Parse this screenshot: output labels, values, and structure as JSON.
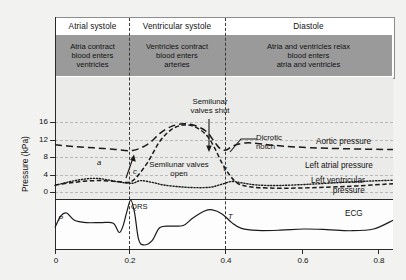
{
  "header": {
    "phases": [
      {
        "name": "Atrial systole",
        "desc": [
          "Atria contract",
          "blood enters",
          "ventricles"
        ]
      },
      {
        "name": "Ventricular systole",
        "desc": [
          "Ventricles contract",
          "blood enters",
          "arteries"
        ]
      },
      {
        "name": "Diastole",
        "desc": [
          "Atria and ventricles relax",
          "blood enters",
          "atria and ventricles"
        ]
      }
    ]
  },
  "annotations": {
    "semilunar_shut": [
      "Semilunar",
      "valves shut"
    ],
    "dicrotic_notch": [
      "Dicrotic",
      "notch"
    ],
    "semilunar_open": [
      "Semilunar valves",
      "open"
    ],
    "wave_a": "a",
    "wave_c": "c",
    "wave_v": "v",
    "ecg_p": "P",
    "ecg_qrs": "QRS",
    "ecg_t": "T"
  },
  "curve_labels": {
    "aortic": "Aortic pressure",
    "atrial": "Left atrial pressure",
    "ventricular": [
      "Left ventricular",
      "pressure"
    ],
    "ecg": "ECG"
  },
  "chart_data": {
    "type": "line",
    "title": "",
    "xlabel": "",
    "ylabel": "Pressure (kPa)",
    "xlim": [
      0,
      0.87
    ],
    "ylim": [
      0,
      18
    ],
    "xticks": [
      "0",
      "0.2",
      "0.4",
      "0.6",
      "0.8"
    ],
    "xtick_values": [
      0,
      0.2,
      0.4,
      0.6,
      0.8
    ],
    "yticks": [
      "0",
      "4",
      "8",
      "12",
      "16"
    ],
    "ytick_values": [
      0,
      4,
      8,
      12,
      16
    ],
    "grid": true,
    "legend": "right-inline",
    "phase_boundaries": [
      0.2,
      0.4
    ],
    "series": [
      {
        "name": "Aortic pressure",
        "style": "long-dash",
        "points": [
          [
            0.0,
            10.8
          ],
          [
            0.05,
            10.4
          ],
          [
            0.1,
            10.1
          ],
          [
            0.15,
            9.8
          ],
          [
            0.2,
            9.5
          ],
          [
            0.24,
            11.0
          ],
          [
            0.27,
            13.4
          ],
          [
            0.3,
            15.0
          ],
          [
            0.33,
            15.6
          ],
          [
            0.36,
            15.2
          ],
          [
            0.39,
            13.8
          ],
          [
            0.41,
            11.5
          ],
          [
            0.425,
            9.9
          ],
          [
            0.44,
            9.6
          ],
          [
            0.46,
            10.6
          ],
          [
            0.49,
            11.2
          ],
          [
            0.52,
            11.1
          ],
          [
            0.56,
            10.7
          ],
          [
            0.62,
            10.3
          ],
          [
            0.7,
            10.0
          ],
          [
            0.8,
            9.8
          ],
          [
            0.87,
            9.7
          ]
        ]
      },
      {
        "name": "Left ventricular pressure",
        "style": "dash",
        "points": [
          [
            0.0,
            1.6
          ],
          [
            0.04,
            2.1
          ],
          [
            0.08,
            2.5
          ],
          [
            0.12,
            2.6
          ],
          [
            0.16,
            2.4
          ],
          [
            0.19,
            2.2
          ],
          [
            0.21,
            3.4
          ],
          [
            0.24,
            7.0
          ],
          [
            0.27,
            11.6
          ],
          [
            0.3,
            14.3
          ],
          [
            0.33,
            15.3
          ],
          [
            0.36,
            14.9
          ],
          [
            0.39,
            13.0
          ],
          [
            0.41,
            10.2
          ],
          [
            0.43,
            6.6
          ],
          [
            0.45,
            3.8
          ],
          [
            0.47,
            2.0
          ],
          [
            0.5,
            1.2
          ],
          [
            0.55,
            0.9
          ],
          [
            0.62,
            0.9
          ],
          [
            0.7,
            1.1
          ],
          [
            0.78,
            1.4
          ],
          [
            0.87,
            1.9
          ]
        ]
      },
      {
        "name": "Left atrial pressure",
        "style": "dot",
        "points": [
          [
            0.0,
            1.5
          ],
          [
            0.04,
            2.4
          ],
          [
            0.08,
            3.0
          ],
          [
            0.11,
            3.1
          ],
          [
            0.14,
            2.7
          ],
          [
            0.17,
            2.2
          ],
          [
            0.2,
            2.0
          ],
          [
            0.22,
            2.6
          ],
          [
            0.25,
            2.2
          ],
          [
            0.28,
            1.6
          ],
          [
            0.32,
            1.2
          ],
          [
            0.36,
            1.0
          ],
          [
            0.4,
            1.1
          ],
          [
            0.43,
            1.8
          ],
          [
            0.455,
            2.4
          ],
          [
            0.48,
            2.1
          ],
          [
            0.52,
            1.6
          ],
          [
            0.58,
            1.5
          ],
          [
            0.66,
            1.8
          ],
          [
            0.74,
            2.2
          ],
          [
            0.81,
            2.5
          ],
          [
            0.87,
            2.7
          ]
        ]
      },
      {
        "name": "ECG",
        "style": "solid",
        "unit": "arbitrary",
        "points": [
          [
            0.0,
            0.05
          ],
          [
            0.015,
            0.45
          ],
          [
            0.03,
            0.55
          ],
          [
            0.05,
            0.3
          ],
          [
            0.08,
            0.22
          ],
          [
            0.12,
            0.22
          ],
          [
            0.15,
            0.2
          ],
          [
            0.165,
            -0.12
          ],
          [
            0.175,
            0.1
          ],
          [
            0.185,
            0.6
          ],
          [
            0.195,
            1.0
          ],
          [
            0.205,
            0.55
          ],
          [
            0.215,
            -0.35
          ],
          [
            0.228,
            -0.55
          ],
          [
            0.25,
            -0.4
          ],
          [
            0.27,
            0.05
          ],
          [
            0.3,
            0.1
          ],
          [
            0.33,
            0.12
          ],
          [
            0.355,
            0.38
          ],
          [
            0.385,
            0.62
          ],
          [
            0.405,
            0.66
          ],
          [
            0.43,
            0.52
          ],
          [
            0.455,
            0.22
          ],
          [
            0.48,
            0.02
          ],
          [
            0.52,
            -0.05
          ],
          [
            0.58,
            -0.04
          ],
          [
            0.64,
            0.0
          ],
          [
            0.7,
            -0.02
          ],
          [
            0.76,
            -0.06
          ],
          [
            0.82,
            0.0
          ],
          [
            0.87,
            0.3
          ]
        ]
      }
    ]
  }
}
